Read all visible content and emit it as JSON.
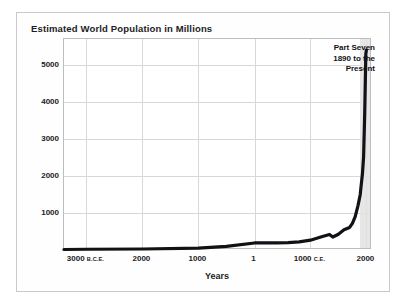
{
  "figure": {
    "title": "Estimated World Population in Millions",
    "xaxis_title": "Years",
    "callout": {
      "line1": "Part Seven",
      "line2": "1890 to the",
      "line3": "Present"
    },
    "colors": {
      "curve": "#111116",
      "grid": "#d8d8d8",
      "shade_band": "#e2e2e2",
      "plot_border": "#bdbdbd",
      "figure_border": "#c9c9c9",
      "text": "#1c1c22",
      "background": "#ffffff"
    }
  },
  "chart_data": {
    "type": "line",
    "title": "Estimated World Population in Millions",
    "xlabel": "Years",
    "ylabel": "",
    "xlim": [
      -3400,
      2100
    ],
    "ylim": [
      0,
      5700
    ],
    "yticks": [
      1000,
      2000,
      3000,
      4000,
      5000
    ],
    "ytick_labels": [
      "1000",
      "2000",
      "3000",
      "4000",
      "5000"
    ],
    "xticks": [
      -3000,
      -2000,
      -1000,
      1,
      1000,
      2000
    ],
    "xtick_labels": [
      "3000",
      "2000",
      "1000",
      "1",
      "1000",
      "2000"
    ],
    "xtick_eras": [
      "B.C.E.",
      "",
      "",
      "",
      "C.E.",
      ""
    ],
    "grid": true,
    "legend": false,
    "annotations": [
      {
        "text": "Part Seven 1890 to the Present",
        "shaded_span": [
          1890,
          2000
        ]
      }
    ],
    "series": [
      {
        "name": "Estimated world population (millions)",
        "x": [
          -3400,
          -3000,
          -2000,
          -1000,
          -500,
          1,
          200,
          400,
          600,
          800,
          1000,
          1200,
          1340,
          1400,
          1500,
          1600,
          1700,
          1750,
          1800,
          1850,
          1890,
          1900,
          1930,
          1950,
          1970,
          1990,
          2000
        ],
        "values": [
          14,
          20,
          27,
          50,
          100,
          190,
          190,
          190,
          200,
          220,
          265,
          360,
          420,
          350,
          425,
          545,
          610,
          720,
          900,
          1200,
          1500,
          1650,
          2070,
          2520,
          3700,
          5300,
          5400
        ]
      }
    ]
  }
}
